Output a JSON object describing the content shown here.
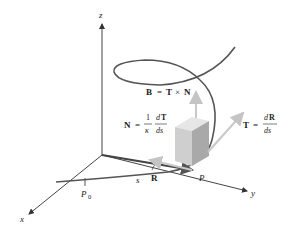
{
  "diagram": {
    "axes": {
      "x": "x",
      "y": "y",
      "z": "z"
    },
    "points": {
      "P": "P",
      "P0": "P",
      "P0_sub": "0"
    },
    "arc_length": "s",
    "position_vector": "R",
    "binormal": {
      "lhs": "B",
      "eq": "=",
      "a": "T",
      "times": "×",
      "b": "N"
    },
    "normal": {
      "lhs": "N",
      "eq": "=",
      "num1": "1",
      "den1": "κ",
      "num2": "dT",
      "num2_d": "d",
      "num2_v": "T",
      "den2": "ds"
    },
    "tangent": {
      "lhs": "T",
      "eq": "=",
      "num_d": "d",
      "num_v": "R",
      "den": "ds"
    },
    "colors": {
      "axis": "#333333",
      "curve": "#555555",
      "vector_light": "#c8c8c8",
      "cube_front": "#cfcfcf",
      "cube_top": "#e6e6e6",
      "cube_side": "#a9a9a9"
    }
  }
}
